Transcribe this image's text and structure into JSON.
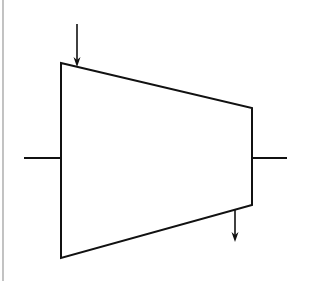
{
  "diagram": {
    "type": "turbine-schematic",
    "colors": {
      "background": "#ffffff",
      "stroke": "#111111",
      "border": "#9a9a9a"
    },
    "elements": {
      "left_border": {
        "x": 3,
        "y1": 0,
        "y2": 281
      },
      "body": {
        "shape": "trapezoid",
        "points": [
          [
            61,
            63
          ],
          [
            252,
            108
          ],
          [
            252,
            205
          ],
          [
            61,
            258
          ]
        ]
      },
      "inlet_arrow": {
        "x": 77,
        "y1": 24,
        "y2": 67,
        "direction": "down"
      },
      "outlet_arrow": {
        "x": 235,
        "y1": 210,
        "y2": 242,
        "direction": "down"
      },
      "left_shaft": {
        "x1": 24,
        "x2": 61,
        "y": 158
      },
      "right_shaft": {
        "x1": 252,
        "x2": 287,
        "y": 158
      }
    }
  }
}
